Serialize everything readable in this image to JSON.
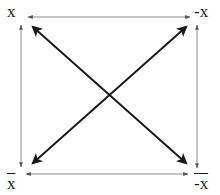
{
  "diagram": {
    "type": "square-of-opposition",
    "corners": {
      "top_left": {
        "label": "x",
        "overline": false
      },
      "top_right": {
        "label": "-x",
        "overline": false
      },
      "bottom_left": {
        "label": "x",
        "overline": true
      },
      "bottom_right": {
        "label": "-x",
        "overline": true
      }
    },
    "edges": [
      {
        "from": "top_left",
        "to": "top_right",
        "style": "thin",
        "heads": "both"
      },
      {
        "from": "bottom_left",
        "to": "bottom_right",
        "style": "thin",
        "heads": "both"
      },
      {
        "from": "top_left",
        "to": "bottom_left",
        "style": "thin",
        "heads": "both"
      },
      {
        "from": "top_right",
        "to": "bottom_right",
        "style": "thin",
        "heads": "both"
      },
      {
        "from": "top_left",
        "to": "bottom_right",
        "style": "thick",
        "heads": "both"
      },
      {
        "from": "top_right",
        "to": "bottom_left",
        "style": "thick",
        "heads": "both"
      }
    ],
    "colors": {
      "thin_line": "#7a7a7a",
      "thick_line": "#1a1a1a",
      "text": "#1a1a1a",
      "background": "#ffffff"
    }
  }
}
